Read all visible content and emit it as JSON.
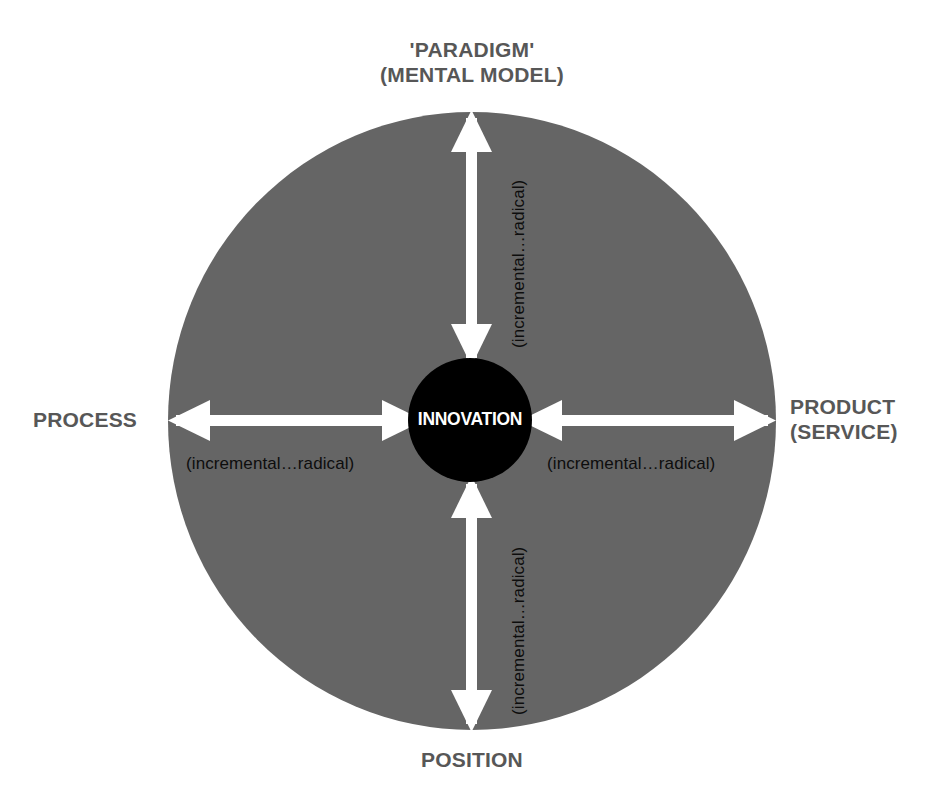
{
  "diagram": {
    "title_text": "Innovation space diagram",
    "center": {
      "label": "INNOVATION",
      "fill_color": "#000000",
      "text_color": "#ffffff"
    },
    "field": {
      "fill_color": "#656565",
      "shape": "ellipse"
    },
    "arrow_color": "#ffffff",
    "outer_label_color": "#575757",
    "axis_note_color": "#0d0d0d",
    "background_color": "#ffffff",
    "axes": [
      {
        "id": "paradigm",
        "direction": "up",
        "outer_label_line1": "'PARADIGM'",
        "outer_label_line2": "(MENTAL MODEL)",
        "note": "(incremental…radical)",
        "orientation": "vertical"
      },
      {
        "id": "product",
        "direction": "right",
        "outer_label_line1": "PRODUCT",
        "outer_label_line2": "(SERVICE)",
        "note": "(incremental…radical)",
        "orientation": "horizontal"
      },
      {
        "id": "position",
        "direction": "down",
        "outer_label_line1": "POSITION",
        "outer_label_line2": "",
        "note": "(incremental…radical)",
        "orientation": "vertical"
      },
      {
        "id": "process",
        "direction": "left",
        "outer_label_line1": "PROCESS",
        "outer_label_line2": "",
        "note": "(incremental…radical)",
        "orientation": "horizontal"
      }
    ]
  }
}
